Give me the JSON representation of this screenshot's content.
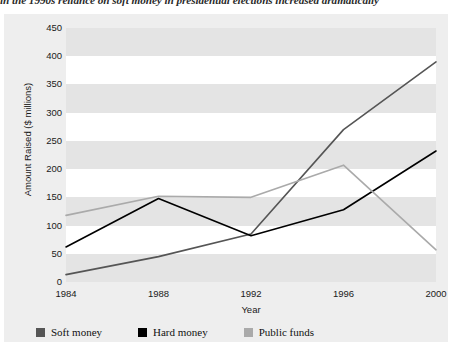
{
  "caption": {
    "text": "in the 1990s reliance on soft money in presidential elections increased dramatically"
  },
  "legend": {
    "position": "bottom-left",
    "items": [
      {
        "label": "Soft money",
        "color": "#555555",
        "swatch_name": "soft-money-swatch"
      },
      {
        "label": "Hard money",
        "color": "#000000",
        "swatch_name": "hard-money-swatch"
      },
      {
        "label": "Public funds",
        "color": "#aaaaaa",
        "swatch_name": "public-funds-swatch"
      }
    ]
  },
  "chart_data": {
    "type": "line",
    "title": "",
    "xlabel": "Year",
    "ylabel": "Amount Raised ($ millions)",
    "categories": [
      "1984",
      "1988",
      "1992",
      "1996",
      "2000"
    ],
    "x": [
      1984,
      1988,
      1992,
      1996,
      2000
    ],
    "xlim": [
      1984,
      2000
    ],
    "ylim": [
      0,
      450
    ],
    "yticks": [
      0,
      50,
      100,
      150,
      200,
      250,
      300,
      350,
      400,
      450
    ],
    "ytick_labels": [
      "0",
      "50",
      "100",
      "150",
      "200",
      "250",
      "300",
      "350",
      "400",
      "450"
    ],
    "grid": "horizontal-bands",
    "legend_position": "bottom-left",
    "series": [
      {
        "name": "Soft money",
        "color": "#555555",
        "values": [
          13,
          45,
          85,
          270,
          390
        ]
      },
      {
        "name": "Hard money",
        "color": "#000000",
        "values": [
          62,
          148,
          82,
          128,
          232
        ]
      },
      {
        "name": "Public funds",
        "color": "#aaaaaa",
        "values": [
          118,
          152,
          150,
          207,
          57
        ]
      }
    ]
  }
}
